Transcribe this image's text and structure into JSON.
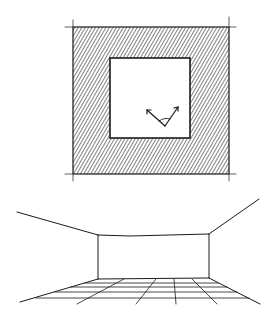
{
  "figure": {
    "plan": {
      "outer": {
        "x": 73,
        "y": 27,
        "w": 156,
        "h": 147
      },
      "inner": {
        "x": 110,
        "y": 58,
        "w": 80,
        "h": 80
      },
      "hatch_color": "#1a1a1a",
      "view_vertex": [
        165,
        126
      ],
      "view_left_tip": [
        147,
        110
      ],
      "view_right_tip": [
        178,
        107
      ]
    },
    "perspective": {
      "back_wall": {
        "x1": 98,
        "y1": 235,
        "x2": 209,
        "y2": 278
      },
      "ceiling_left": [
        17,
        212
      ],
      "ceiling_right": [
        259,
        199
      ],
      "floor_left": [
        20,
        302
      ],
      "floor_right": [
        260,
        304
      ],
      "floor_rows_y": [
        283,
        287,
        292,
        298
      ]
    }
  }
}
